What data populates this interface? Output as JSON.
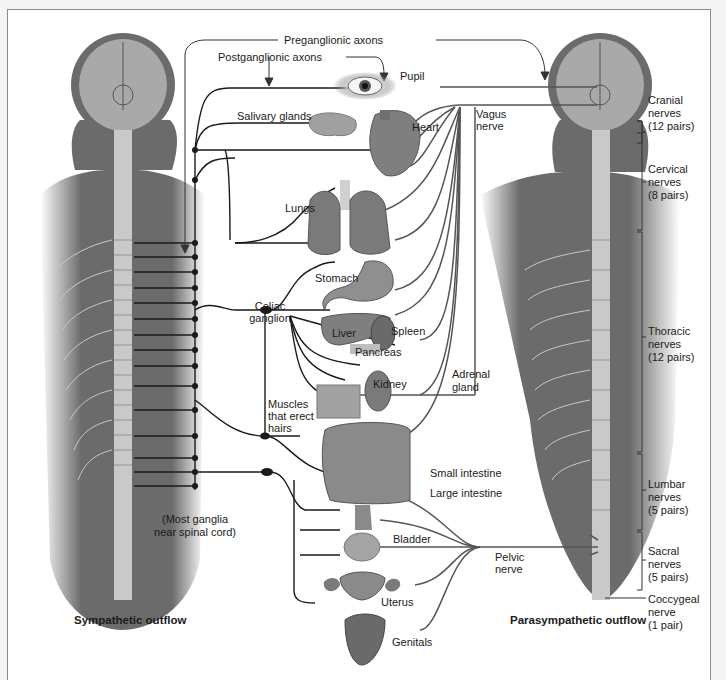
{
  "figure": {
    "top_labels": {
      "preganglionic": "Preganglionic axons",
      "postganglionic": "Postganglionic axons"
    },
    "organs": {
      "pupil": "Pupil",
      "salivary": "Salivary glands",
      "heart": "Heart",
      "lungs": "Lungs",
      "stomach": "Stomach",
      "liver": "Liver",
      "spleen": "Spleen",
      "pancreas": "Pancreas",
      "kidney": "Kidney",
      "adrenal": "Adrenal gland",
      "small_intestine": "Small intestine",
      "large_intestine": "Large intestine",
      "bladder": "Bladder",
      "uterus": "Uterus",
      "genitals": "Genitals"
    },
    "ganglia": {
      "celiac_1": "Celiac",
      "celiac_2": "ganglion",
      "muscles_1": "Muscles",
      "muscles_2": "that erect",
      "muscles_3": "hairs",
      "most_1": "(Most ganglia",
      "most_2": "near spinal cord)"
    },
    "nerves": {
      "vagus_1": "Vagus",
      "vagus_2": "nerve",
      "pelvic_1": "Pelvic",
      "pelvic_2": "nerve"
    },
    "spinal_regions": [
      {
        "name": "Cranial",
        "line2": "nerves",
        "line3": "(12 pairs)"
      },
      {
        "name": "Cervical",
        "line2": "nerves",
        "line3": "(8 pairs)"
      },
      {
        "name": "Thoracic",
        "line2": "nerves",
        "line3": "(12 pairs)"
      },
      {
        "name": "Lumbar",
        "line2": "nerves",
        "line3": "(5 pairs)"
      },
      {
        "name": "Sacral",
        "line2": "nerves",
        "line3": "(5 pairs)"
      },
      {
        "name": "Coccygeal",
        "line2": "nerve",
        "line3": "(1 pair)"
      }
    ],
    "captions": {
      "left": "Sympathetic outflow",
      "right": "Parasympathetic outflow"
    },
    "colors": {
      "body": "#6b6b6b",
      "head": "#a9a9a9",
      "nerve_dark": "#1a1a1a",
      "organ": "#8c8c8c"
    }
  }
}
